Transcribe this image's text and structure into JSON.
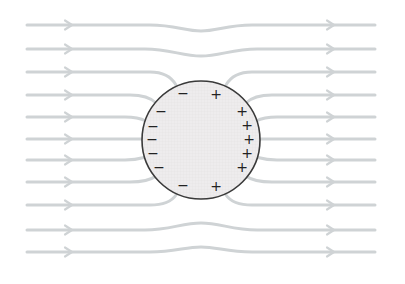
{
  "diagram": {
    "colors": {
      "background": "#ffffff",
      "field_line": "#cfd3d5",
      "sphere_fill": "#eeeced",
      "sphere_grid": "#e2dfe1",
      "sphere_stroke": "#3a3a3a",
      "charge": "#222222"
    },
    "sphere": {
      "cx": 201,
      "cy": 140,
      "r": 59
    },
    "field_lines": [
      {
        "id": "line-1",
        "d": "M27,25 L150,25 C175,25 185,31 201,31 C217,31 227,25 252,25 L375,25",
        "arrows_x": [
          70,
          332
        ],
        "arrow_y": [
          25,
          25
        ]
      },
      {
        "id": "line-2",
        "d": "M27,49 L145,49 C170,49 182,56 201,56 C220,56 232,49 257,49 L375,49",
        "arrows_x": [
          70,
          332
        ],
        "arrow_y": [
          49,
          49
        ]
      },
      {
        "id": "line-3-left",
        "d": "M27,72 L150,72 C165,72 172,78 176,85",
        "arrows_x": [
          70
        ],
        "arrow_y": [
          72
        ]
      },
      {
        "id": "line-3-right",
        "d": "M226,85 C230,78 237,72 252,72 L375,72",
        "arrows_x": [
          332
        ],
        "arrow_y": [
          72
        ]
      },
      {
        "id": "line-4-left",
        "d": "M27,95 L130,95 C145,95 152,99 156,103",
        "arrows_x": [
          70
        ],
        "arrow_y": [
          95
        ]
      },
      {
        "id": "line-4-right",
        "d": "M246,103 C250,99 257,95 272,95 L375,95",
        "arrows_x": [
          332
        ],
        "arrow_y": [
          95
        ]
      },
      {
        "id": "line-5-left",
        "d": "M27,117 L125,117 C137,117 142,119 146,121",
        "arrows_x": [
          70
        ],
        "arrow_y": [
          117
        ]
      },
      {
        "id": "line-5-right",
        "d": "M256,121 C260,119 265,117 277,117 L375,117",
        "arrows_x": [
          332
        ],
        "arrow_y": [
          117
        ]
      },
      {
        "id": "line-6-left",
        "d": "M27,139 L142,139",
        "arrows_x": [
          70
        ],
        "arrow_y": [
          139
        ]
      },
      {
        "id": "line-6-right",
        "d": "M260,139 L375,139",
        "arrows_x": [
          332
        ],
        "arrow_y": [
          139
        ]
      },
      {
        "id": "line-7-left",
        "d": "M27,160 L125,160 C137,160 142,158 146,157",
        "arrows_x": [
          70
        ],
        "arrow_y": [
          160
        ]
      },
      {
        "id": "line-7-right",
        "d": "M256,157 C260,158 265,160 277,160 L375,160",
        "arrows_x": [
          332
        ],
        "arrow_y": [
          160
        ]
      },
      {
        "id": "line-8-left",
        "d": "M27,182 L130,182 C145,182 152,179 156,176",
        "arrows_x": [
          70
        ],
        "arrow_y": [
          182
        ]
      },
      {
        "id": "line-8-right",
        "d": "M246,176 C250,179 257,182 272,182 L375,182",
        "arrows_x": [
          332
        ],
        "arrow_y": [
          182
        ]
      },
      {
        "id": "line-9-left",
        "d": "M27,205 L150,205 C165,205 172,201 176,195",
        "arrows_x": [
          70
        ],
        "arrow_y": [
          205
        ]
      },
      {
        "id": "line-9-right",
        "d": "M226,195 C230,201 237,205 252,205 L375,205",
        "arrows_x": [
          332
        ],
        "arrow_y": [
          205
        ]
      },
      {
        "id": "line-10",
        "d": "M27,230 L145,230 C170,230 182,223 201,223 C220,223 232,230 257,230 L375,230",
        "arrows_x": [
          70,
          332
        ],
        "arrow_y": [
          230,
          230
        ]
      },
      {
        "id": "line-11",
        "d": "M27,252 L150,252 C175,252 185,247 201,247 C217,247 227,252 252,252 L375,252",
        "arrows_x": [
          70,
          332
        ],
        "arrow_y": [
          252,
          252
        ]
      }
    ],
    "negative_charges": [
      {
        "x": 183,
        "y": 93
      },
      {
        "x": 161,
        "y": 111
      },
      {
        "x": 153,
        "y": 126
      },
      {
        "x": 152,
        "y": 139
      },
      {
        "x": 153,
        "y": 153
      },
      {
        "x": 159,
        "y": 167
      },
      {
        "x": 183,
        "y": 185
      }
    ],
    "positive_charges": [
      {
        "x": 216,
        "y": 94
      },
      {
        "x": 242,
        "y": 111
      },
      {
        "x": 247,
        "y": 125
      },
      {
        "x": 249,
        "y": 139
      },
      {
        "x": 247,
        "y": 153
      },
      {
        "x": 242,
        "y": 167
      },
      {
        "x": 216,
        "y": 186
      }
    ],
    "labels": {
      "negative_symbol": "−",
      "positive_symbol": "+"
    }
  }
}
